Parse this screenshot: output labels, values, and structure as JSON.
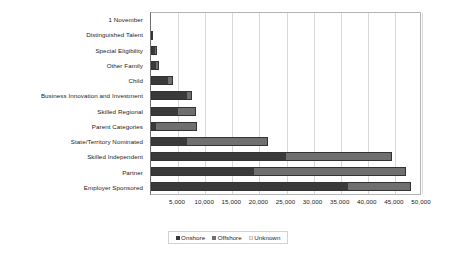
{
  "chart_data": {
    "type": "bar",
    "orientation": "horizontal",
    "stacked": true,
    "title": "",
    "xlabel": "",
    "ylabel": "",
    "xlim": [
      0,
      50000
    ],
    "grid": true,
    "legend_position": "bottom",
    "categories": [
      "1 November",
      "Distinguished Talent",
      "Special Eligibility",
      "Other Family",
      "Child",
      "Business Innovation and Investment",
      "Skilled Regional",
      "Parent Categories",
      "State/Territory Nominated",
      "Skilled Independent",
      "Partner",
      "Employer Sponsored"
    ],
    "tick_labels": [
      "5,000",
      "10,000",
      "15,000",
      "20,000",
      "25,000",
      "30,000",
      "35,000",
      "40,000",
      "45,000",
      "50,000"
    ],
    "tick_values": [
      5000,
      10000,
      15000,
      20000,
      25000,
      30000,
      35000,
      40000,
      45000,
      50000
    ],
    "series": [
      {
        "name": "Onshore",
        "color": "#3a3a3a",
        "values": [
          0,
          300,
          900,
          1100,
          3300,
          6800,
          5100,
          700,
          6500,
          25000,
          19000,
          36500
        ]
      },
      {
        "name": "Offshore",
        "color": "#6f6f6f",
        "values": [
          0,
          100,
          200,
          300,
          700,
          700,
          3200,
          7700,
          15000,
          19500,
          28000,
          11500
        ]
      },
      {
        "name": "Unknown",
        "color": "#e2e2e2",
        "values": [
          0,
          0,
          0,
          0,
          0,
          0,
          0,
          0,
          0,
          0,
          0,
          0
        ]
      }
    ]
  },
  "legend": {
    "entries": [
      {
        "label": "Onshore"
      },
      {
        "label": "Offshore"
      },
      {
        "label": "Unknown"
      }
    ]
  }
}
